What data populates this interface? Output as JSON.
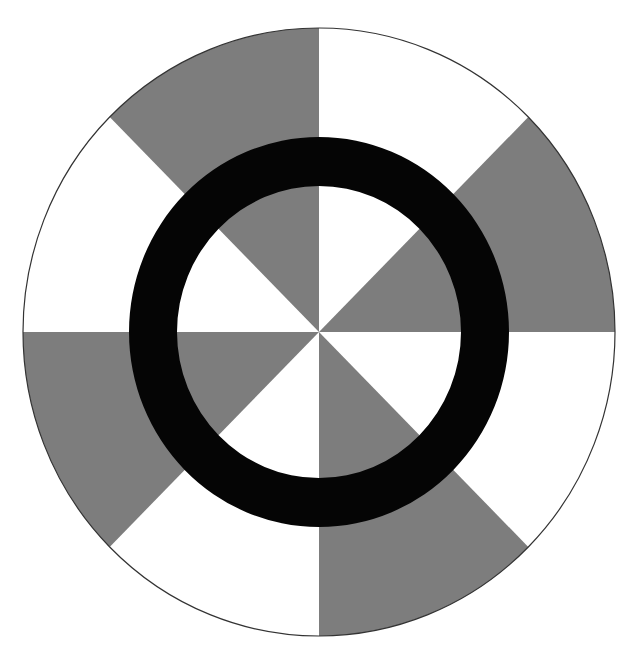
{
  "diagram": {
    "description": "Circle divided into 8 equal sectors alternating gray and white, overlaid with a concentric black ring",
    "center": [
      319,
      332
    ],
    "outer_circle": {
      "rx": 296,
      "ry": 304,
      "stroke": "#333333",
      "fill": "#ffffff"
    },
    "sector_count": 8,
    "sectors": [
      {
        "position": "top-right",
        "fill": "#ffffff"
      },
      {
        "position": "right-upper",
        "fill": "#7d7d7d"
      },
      {
        "position": "right-lower",
        "fill": "#ffffff"
      },
      {
        "position": "bottom-right",
        "fill": "#7d7d7d"
      },
      {
        "position": "bottom-left",
        "fill": "#ffffff"
      },
      {
        "position": "left-lower",
        "fill": "#7d7d7d"
      },
      {
        "position": "left-upper",
        "fill": "#ffffff"
      },
      {
        "position": "top-left",
        "fill": "#7d7d7d"
      }
    ],
    "ring": {
      "outer_rx": 190,
      "outer_ry": 195,
      "inner_rx": 142,
      "inner_ry": 146,
      "color": "#050505"
    },
    "colors": {
      "gray": "#7d7d7d",
      "white": "#ffffff",
      "black": "#050505",
      "outline": "#333333"
    }
  }
}
